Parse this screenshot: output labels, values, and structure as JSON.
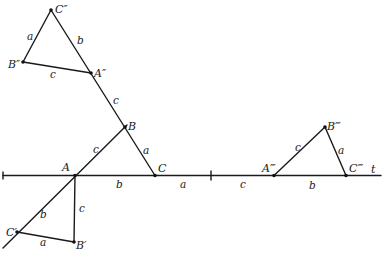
{
  "diagram": {
    "width": 386,
    "height": 259,
    "stroke_color": "#1a1a1a",
    "baseline": {
      "label": "t",
      "x1": 3,
      "y1": 175.5,
      "x2": 381,
      "y2": 175.5,
      "label_pos": [
        371,
        173
      ],
      "tick": {
        "x": 211,
        "y1": 171,
        "y2": 180
      },
      "start_tick": {
        "x": 3,
        "y1": 172,
        "y2": 179
      }
    },
    "points": {
      "A": {
        "label": "A",
        "x": 75,
        "y": 175.5,
        "lx": 62,
        "ly": 171
      },
      "B": {
        "label": "B",
        "x": 125,
        "y": 127,
        "lx": 128,
        "ly": 130
      },
      "C": {
        "label": "C",
        "x": 155,
        "y": 175.5,
        "lx": 158,
        "ly": 172
      },
      "A2": {
        "label": "A″",
        "x": 91,
        "y": 73,
        "lx": 94,
        "ly": 77
      },
      "B2": {
        "label": "B″",
        "x": 23,
        "y": 62,
        "lx": 8,
        "ly": 68
      },
      "C2": {
        "label": "C″",
        "x": 51,
        "y": 10,
        "lx": 55,
        "ly": 13
      },
      "A1": {
        "label": "C′",
        "x": 17,
        "y": 232,
        "lx": 6,
        "ly": 236
      },
      "B1": {
        "label": "B′",
        "x": 74,
        "y": 242,
        "lx": 76,
        "ly": 249
      },
      "A3": {
        "label": "A‴",
        "x": 274,
        "y": 175.5,
        "lx": 262,
        "ly": 172
      },
      "B3": {
        "label": "B‴",
        "x": 325,
        "y": 127,
        "lx": 327,
        "ly": 130
      },
      "C3": {
        "label": "C‴",
        "x": 346,
        "y": 175.5,
        "lx": 349,
        "ly": 172
      }
    },
    "segments": [
      {
        "name": "line-c2-to-c",
        "x1": 51,
        "y1": 10,
        "x2": 155,
        "y2": 175.5
      },
      {
        "name": "line-b2-c2",
        "x1": 23,
        "y1": 62,
        "x2": 51,
        "y2": 10
      },
      {
        "name": "line-b2-a2",
        "x1": 23,
        "y1": 62,
        "x2": 91,
        "y2": 73
      },
      {
        "name": "line-a-b-extended",
        "x1": 3,
        "y1": 248,
        "x2": 127,
        "y2": 125
      },
      {
        "name": "line-a-b1",
        "x1": 75,
        "y1": 175.5,
        "x2": 74,
        "y2": 242
      },
      {
        "name": "line-c1-b1",
        "x1": 17,
        "y1": 232,
        "x2": 74,
        "y2": 242
      },
      {
        "name": "line-a3-b3",
        "x1": 274,
        "y1": 175.5,
        "x2": 325,
        "y2": 127
      },
      {
        "name": "line-b3-c3",
        "x1": 325,
        "y1": 127,
        "x2": 346,
        "y2": 175.5
      }
    ],
    "side_labels": [
      {
        "name": "side-a-b2c2",
        "text": "a",
        "x": 27,
        "y": 40
      },
      {
        "name": "side-b-c2a2",
        "text": "b",
        "x": 77,
        "y": 44
      },
      {
        "name": "side-c-b2a2",
        "text": "c",
        "x": 50,
        "y": 78
      },
      {
        "name": "side-c-a2b",
        "text": "c",
        "x": 113,
        "y": 104
      },
      {
        "name": "side-c-ab",
        "text": "c",
        "x": 93,
        "y": 153
      },
      {
        "name": "side-a-bc",
        "text": "a",
        "x": 143,
        "y": 154
      },
      {
        "name": "side-b-ac",
        "text": "b",
        "x": 116,
        "y": 188
      },
      {
        "name": "side-a-baseline",
        "text": "a",
        "x": 180,
        "y": 188
      },
      {
        "name": "side-c-baseline",
        "text": "c",
        "x": 240,
        "y": 188
      },
      {
        "name": "side-b-ac1",
        "text": "b",
        "x": 40,
        "y": 218
      },
      {
        "name": "side-c-ab1",
        "text": "c",
        "x": 79,
        "y": 212
      },
      {
        "name": "side-a-c1b1",
        "text": "a",
        "x": 40,
        "y": 246
      },
      {
        "name": "side-c-a3b3",
        "text": "c",
        "x": 295,
        "y": 151
      },
      {
        "name": "side-a-b3c3",
        "text": "a",
        "x": 338,
        "y": 154
      },
      {
        "name": "side-b-a3c3",
        "text": "b",
        "x": 309,
        "y": 189
      }
    ]
  }
}
